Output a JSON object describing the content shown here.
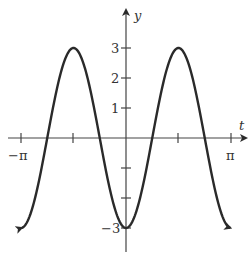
{
  "chart_data": {
    "type": "line",
    "title": "",
    "function": "y = -3cos(2t)",
    "xlabel": "t",
    "ylabel": "y",
    "x_ticks": [
      {
        "value": "-pi",
        "label": "−π"
      },
      {
        "value": "-pi/2",
        "label": ""
      },
      {
        "value": "0",
        "label": ""
      },
      {
        "value": "pi/2",
        "label": ""
      },
      {
        "value": "pi",
        "label": "π"
      }
    ],
    "y_ticks": [
      {
        "value": 3,
        "label": "3"
      },
      {
        "value": 2,
        "label": "2"
      },
      {
        "value": 1,
        "label": "1"
      },
      {
        "value": -1,
        "label": ""
      },
      {
        "value": -2,
        "label": ""
      },
      {
        "value": -3,
        "label": "−3"
      }
    ],
    "xlim": [
      "-pi",
      "pi"
    ],
    "ylim": [
      -3,
      3
    ],
    "series": [
      {
        "name": "y(t)",
        "x": [
          -3.1416,
          -2.3562,
          -1.5708,
          -0.7854,
          0,
          0.7854,
          1.5708,
          2.3562,
          3.1416
        ],
        "values": [
          -3,
          0,
          3,
          0,
          -3,
          0,
          3,
          0,
          -3
        ]
      }
    ],
    "grid": false,
    "legend": "none",
    "line_color": "#2a2a2a"
  },
  "labels": {
    "x_axis": "t",
    "y_axis": "y",
    "neg_pi": "−π",
    "pi": "π",
    "y3": "3",
    "y2": "2",
    "y1": "1",
    "ym3": "−3"
  }
}
